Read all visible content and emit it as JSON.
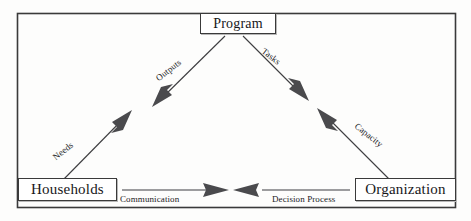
{
  "figure": {
    "frame_color": "#3a3a3a",
    "background_color": "#fdfdfc",
    "line_color": "#3d3d40",
    "arrow_fill": "#4a4a4d",
    "text_color": "#17171a"
  },
  "nodes": {
    "program": {
      "label": "Program"
    },
    "households": {
      "label": "Households"
    },
    "organization": {
      "label": "Organization"
    }
  },
  "edges": {
    "needs": {
      "label": "Needs",
      "from": "Households",
      "to": "Program",
      "direction": "up-right"
    },
    "outputs": {
      "label": "Outputs",
      "from": "Program",
      "to": "Households",
      "direction": "down-left"
    },
    "tasks": {
      "label": "Tasks",
      "from": "Program",
      "to": "Organization",
      "direction": "down-right"
    },
    "capacity": {
      "label": "Capacity",
      "from": "Organization",
      "to": "Program",
      "direction": "up-left"
    },
    "communication": {
      "label": "Communication",
      "from": "Households",
      "to": "center",
      "direction": "right"
    },
    "decision_process": {
      "label": "Decision Process",
      "from": "Organization",
      "to": "center",
      "direction": "left"
    }
  }
}
